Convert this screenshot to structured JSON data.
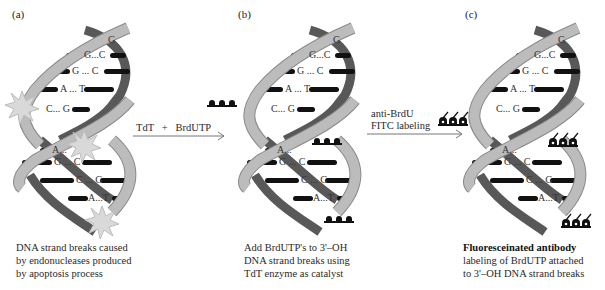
{
  "figure": {
    "panels": [
      {
        "id": "a",
        "label": "(a)",
        "base_pairs": [
          "G",
          "G...C",
          "G ... C",
          "A ... T",
          "C... G",
          "A...",
          "G ... C",
          "C ... G",
          "A...T"
        ],
        "caption": [
          "DNA strand breaks caused",
          "by endonucleases produced",
          "by apoptosis process"
        ],
        "markers": "strand-break-stars"
      },
      {
        "id": "b",
        "label": "(b)",
        "base_pairs": [
          "G",
          "G...C",
          "G ... C",
          "A ... T",
          "C... G",
          "A...T",
          "G ... C",
          "C ... G",
          "A...T"
        ],
        "caption": [
          "Add BrdUTP's to 3'–OH",
          "DNA strand breaks using",
          "TdT enzyme as catalyst"
        ],
        "markers": "brdutp-groups"
      },
      {
        "id": "c",
        "label": "(c)",
        "base_pairs": [
          "G",
          "G...C",
          "G ... C",
          "A ... T",
          "C... G",
          "A...T",
          "G ... C",
          "C ... G",
          "A...T"
        ],
        "caption_bold": "Fluoresceinated antibody",
        "caption": [
          "labeling of BrdUTP attached",
          "to 3'–OH DNA strand breaks"
        ],
        "markers": "fitc-antibody-groups"
      }
    ],
    "arrows": [
      {
        "id": "a-to-b",
        "label_line1": "TdT   +   BrdUTP",
        "label_line2": ""
      },
      {
        "id": "b-to-c",
        "label_line1": "anti-BrdU",
        "label_line2": "FITC labeling"
      }
    ],
    "colors": {
      "light_strand": "#b8b8b8",
      "light_strand_edge": "#8a8a8a",
      "dark_strand": "#585858",
      "base_bar": "#111111",
      "star_fill": "#d9d9d9",
      "star_edge": "#bdbdbd",
      "text": "#2a2a2a"
    }
  }
}
